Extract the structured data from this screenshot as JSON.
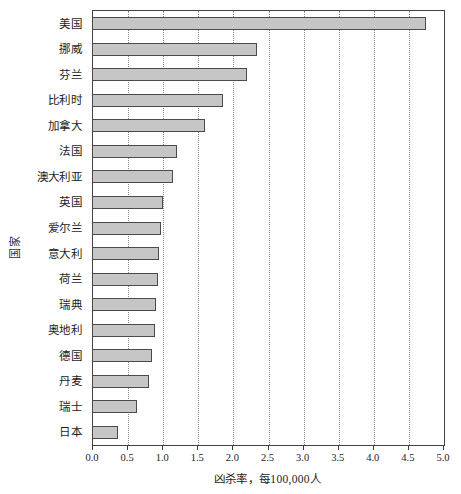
{
  "chart_data": {
    "type": "bar",
    "orientation": "horizontal",
    "title": "",
    "xlabel": "凶杀率，每100,000人",
    "ylabel": "国家",
    "xlim": [
      0.0,
      5.0
    ],
    "xticks": [
      "0.0",
      "0.5",
      "1.0",
      "1.5",
      "2.0",
      "2.5",
      "3.0",
      "3.5",
      "4.0",
      "4.5",
      "5.0"
    ],
    "xtick_values": [
      0.0,
      0.5,
      1.0,
      1.5,
      2.0,
      2.5,
      3.0,
      3.5,
      4.0,
      4.5,
      5.0
    ],
    "grid": true,
    "grid_axis": "x",
    "grid_style": "dotted",
    "legend": false,
    "categories": [
      "美国",
      "挪威",
      "芬兰",
      "比利时",
      "加拿大",
      "法国",
      "澳大利亚",
      "英国",
      "爱尔兰",
      "意大利",
      "荷兰",
      "瑞典",
      "奥地利",
      "德国",
      "丹麦",
      "瑞士",
      "日本"
    ],
    "values": [
      4.75,
      2.33,
      2.19,
      1.85,
      1.6,
      1.2,
      1.14,
      1.0,
      0.97,
      0.94,
      0.92,
      0.9,
      0.88,
      0.84,
      0.8,
      0.62,
      0.36
    ],
    "series": [
      {
        "name": "凶杀率",
        "values": [
          4.75,
          2.33,
          2.19,
          1.85,
          1.6,
          1.2,
          1.14,
          1.0,
          0.97,
          0.94,
          0.92,
          0.9,
          0.88,
          0.84,
          0.8,
          0.62,
          0.36
        ]
      }
    ]
  },
  "colors": {
    "bar_fill": "#c6c6c6",
    "bar_edge": "#4a4a4a",
    "grid": "#8a8a8a",
    "axis": "#444444",
    "text": "#1d1d1d",
    "background": "#ffffff"
  }
}
